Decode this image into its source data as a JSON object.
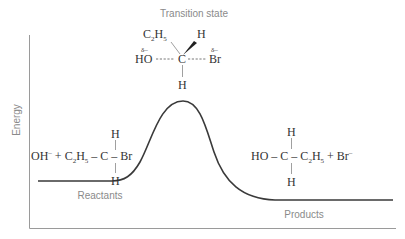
{
  "diagram": {
    "type": "reaction-energy-profile",
    "y_axis_label": "Energy",
    "labels": {
      "transition_state": "Transition state",
      "reactants": "Reactants",
      "products": "Products"
    },
    "transition_state_structure": {
      "top_left": "C",
      "top_left_sub1": "2",
      "top_left_h": "H",
      "top_left_sub2": "5",
      "top_right": "H",
      "left_partial": "δ–",
      "left_group": "HO",
      "center": "C",
      "right_partial": "δ–",
      "right_group": "Br",
      "bottom": "H"
    },
    "reactants_structure": {
      "ion": "OH",
      "ion_charge": "–",
      "plus": "+",
      "ethyl_c": "C",
      "ethyl_sub1": "2",
      "ethyl_h": "H",
      "ethyl_sub2": "5",
      "bond1": "–",
      "center": "C",
      "bond2": "–",
      "leaving": "Br",
      "top": "H",
      "bottom": "H"
    },
    "products_structure": {
      "group": "HO",
      "bond1": "–",
      "center": "C",
      "bond2": "–",
      "ethyl_c": "C",
      "ethyl_sub1": "2",
      "ethyl_h": "H",
      "ethyl_sub2": "5",
      "plus": "+",
      "ion": "Br",
      "ion_charge": "–",
      "top": "H",
      "bottom": "H"
    },
    "profile": {
      "reactant_level_y": 181,
      "peak_y": 101,
      "product_level_y": 200
    },
    "colors": {
      "curve": "#3a3a3a",
      "axis": "#9a9a9a",
      "label_text": "#8a8a8a",
      "formula_text": "#333333"
    }
  }
}
